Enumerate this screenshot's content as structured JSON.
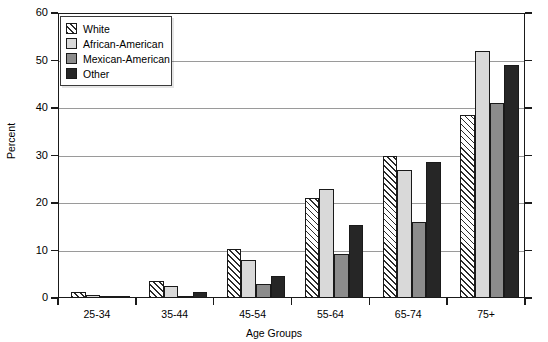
{
  "chart_data": {
    "type": "bar",
    "title": "",
    "xlabel": "Age Groups",
    "ylabel": "Percent",
    "ylim": [
      0,
      60
    ],
    "yticks": [
      0,
      10,
      20,
      30,
      40,
      50,
      60
    ],
    "grid": true,
    "legend_position": "top-left",
    "categories": [
      "25-34",
      "35-44",
      "45-54",
      "55-64",
      "65-74",
      "75+"
    ],
    "series": [
      {
        "name": "White",
        "pattern": "diagonal-hatch",
        "color": "#ffffff",
        "values": [
          1.3,
          3.5,
          10.3,
          21.0,
          29.8,
          38.5
        ]
      },
      {
        "name": "African-American",
        "pattern": "solid",
        "color": "#d9d9d9",
        "values": [
          0.6,
          2.5,
          8.0,
          23.0,
          27.0,
          52.0
        ]
      },
      {
        "name": "Mexican-American",
        "pattern": "solid",
        "color": "#8c8c8c",
        "values": [
          0.4,
          0.3,
          3.0,
          9.3,
          16.0,
          41.0
        ]
      },
      {
        "name": "Other",
        "pattern": "solid",
        "color": "#262626",
        "values": [
          0.3,
          1.2,
          4.6,
          15.3,
          28.7,
          49.0
        ]
      }
    ]
  },
  "axes": {
    "y_title": "Percent",
    "x_title": "Age Groups",
    "y_tick_labels": [
      "0",
      "10",
      "20",
      "30",
      "40",
      "50",
      "60"
    ],
    "x_tick_labels": [
      "25-34",
      "35-44",
      "45-54",
      "55-64",
      "65-74",
      "75+"
    ]
  },
  "legend": {
    "items": [
      {
        "label": "White"
      },
      {
        "label": "African-American"
      },
      {
        "label": "Mexican-American"
      },
      {
        "label": "Other"
      }
    ]
  }
}
